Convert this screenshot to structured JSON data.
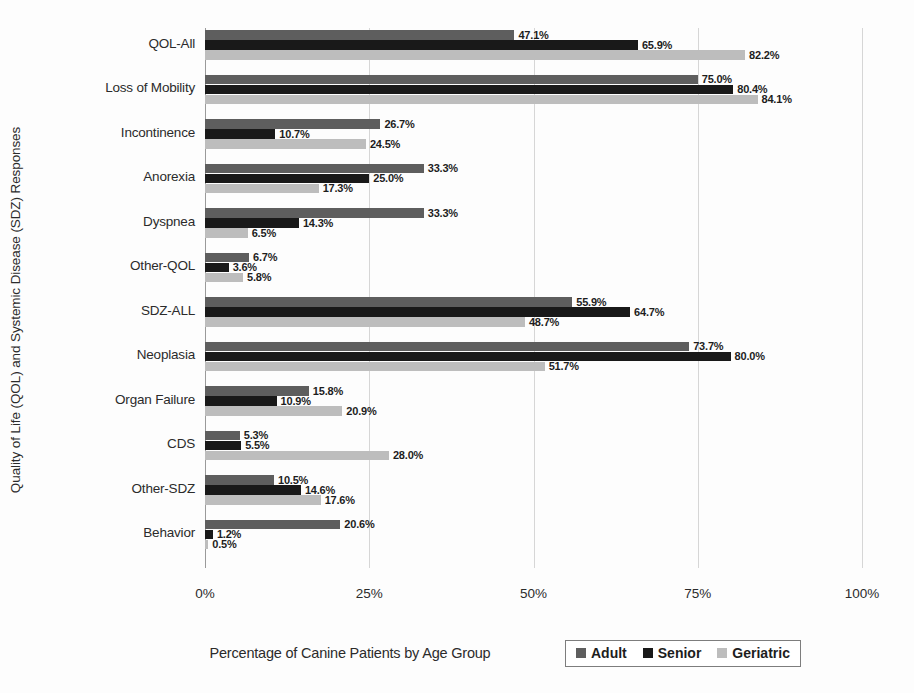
{
  "chart_data": {
    "type": "bar",
    "orientation": "horizontal",
    "title": "",
    "xlabel": "Percentage of Canine Patients by Age Group",
    "ylabel": "Quality of Life (QOL) and Systemic Disease (SDZ) Responses",
    "xlim": [
      0,
      100
    ],
    "xticks": [
      "0%",
      "25%",
      "50%",
      "75%",
      "100%"
    ],
    "xtick_values": [
      0,
      25,
      50,
      75,
      100
    ],
    "grid": true,
    "legend_position": "bottom-right",
    "categories": [
      "QOL-All",
      "Loss of Mobility",
      "Incontinence",
      "Anorexia",
      "Dyspnea",
      "Other-QOL",
      "SDZ-ALL",
      "Neoplasia",
      "Organ Failure",
      "CDS",
      "Other-SDZ",
      "Behavior"
    ],
    "series": [
      {
        "name": "Adult",
        "color": "#5e5e5e",
        "values": [
          47.1,
          75.0,
          26.7,
          33.3,
          33.3,
          6.7,
          55.9,
          73.7,
          15.8,
          5.3,
          10.5,
          20.6
        ],
        "labels": [
          "47.1%",
          "75.0%",
          "26.7%",
          "33.3%",
          "33.3%",
          "6.7%",
          "55.9%",
          "73.7%",
          "15.8%",
          "5.3%",
          "10.5%",
          "20.6%"
        ]
      },
      {
        "name": "Senior",
        "color": "#191919",
        "values": [
          65.9,
          80.4,
          10.7,
          25.0,
          14.3,
          3.6,
          64.7,
          80.0,
          10.9,
          5.5,
          14.6,
          1.2
        ],
        "labels": [
          "65.9%",
          "80.4%",
          "10.7%",
          "25.0%",
          "14.3%",
          "3.6%",
          "64.7%",
          "80.0%",
          "10.9%",
          "5.5%",
          "14.6%",
          "1.2%"
        ]
      },
      {
        "name": "Geriatric",
        "color": "#bdbdbd",
        "values": [
          82.2,
          84.1,
          24.5,
          17.3,
          6.5,
          5.8,
          48.7,
          51.7,
          20.9,
          28.0,
          17.6,
          0.5
        ],
        "labels": [
          "82.2%",
          "84.1%",
          "24.5%",
          "17.3%",
          "6.5%",
          "5.8%",
          "48.7%",
          "51.7%",
          "20.9%",
          "28.0%",
          "17.6%",
          "0.5%"
        ]
      }
    ]
  },
  "legend": {
    "items": [
      {
        "label": "Adult"
      },
      {
        "label": "Senior"
      },
      {
        "label": "Geriatric"
      }
    ]
  }
}
